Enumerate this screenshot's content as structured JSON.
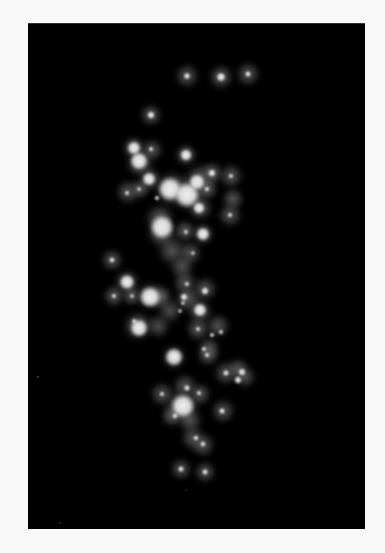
{
  "image": {
    "background": "#f8f8f8",
    "panel_color": "#000000",
    "panel": {
      "x": 28,
      "y": 23,
      "w": 337,
      "h": 505
    }
  },
  "halos": [
    {
      "x": 187,
      "y": 75,
      "r": 12,
      "a": 0.38
    },
    {
      "x": 221,
      "y": 76,
      "r": 12,
      "a": 0.42
    },
    {
      "x": 248,
      "y": 73,
      "r": 12,
      "a": 0.38
    },
    {
      "x": 151,
      "y": 114,
      "r": 11,
      "a": 0.4
    },
    {
      "x": 134,
      "y": 147,
      "r": 11,
      "a": 0.55
    },
    {
      "x": 140,
      "y": 162,
      "r": 13,
      "a": 0.55
    },
    {
      "x": 152,
      "y": 149,
      "r": 11,
      "a": 0.4
    },
    {
      "x": 150,
      "y": 178,
      "r": 11,
      "a": 0.5
    },
    {
      "x": 186,
      "y": 154,
      "r": 11,
      "a": 0.45
    },
    {
      "x": 128,
      "y": 191,
      "r": 12,
      "a": 0.4
    },
    {
      "x": 140,
      "y": 188,
      "r": 10,
      "a": 0.4
    },
    {
      "x": 172,
      "y": 188,
      "r": 16,
      "a": 0.62
    },
    {
      "x": 188,
      "y": 192,
      "r": 16,
      "a": 0.62
    },
    {
      "x": 200,
      "y": 178,
      "r": 14,
      "a": 0.5
    },
    {
      "x": 212,
      "y": 172,
      "r": 11,
      "a": 0.45
    },
    {
      "x": 231,
      "y": 175,
      "r": 12,
      "a": 0.4
    },
    {
      "x": 207,
      "y": 188,
      "r": 11,
      "a": 0.42
    },
    {
      "x": 200,
      "y": 207,
      "r": 12,
      "a": 0.45
    },
    {
      "x": 233,
      "y": 198,
      "r": 11,
      "a": 0.4
    },
    {
      "x": 230,
      "y": 214,
      "r": 12,
      "a": 0.38
    },
    {
      "x": 160,
      "y": 218,
      "r": 14,
      "a": 0.48
    },
    {
      "x": 162,
      "y": 232,
      "r": 14,
      "a": 0.5
    },
    {
      "x": 185,
      "y": 230,
      "r": 11,
      "a": 0.42
    },
    {
      "x": 203,
      "y": 233,
      "r": 11,
      "a": 0.45
    },
    {
      "x": 172,
      "y": 250,
      "r": 14,
      "a": 0.4
    },
    {
      "x": 190,
      "y": 252,
      "r": 12,
      "a": 0.38
    },
    {
      "x": 182,
      "y": 266,
      "r": 12,
      "a": 0.38
    },
    {
      "x": 112,
      "y": 259,
      "r": 11,
      "a": 0.4
    },
    {
      "x": 127,
      "y": 281,
      "r": 12,
      "a": 0.48
    },
    {
      "x": 114,
      "y": 295,
      "r": 11,
      "a": 0.4
    },
    {
      "x": 132,
      "y": 295,
      "r": 10,
      "a": 0.4
    },
    {
      "x": 150,
      "y": 295,
      "r": 13,
      "a": 0.55
    },
    {
      "x": 160,
      "y": 296,
      "r": 12,
      "a": 0.5
    },
    {
      "x": 185,
      "y": 282,
      "r": 12,
      "a": 0.38
    },
    {
      "x": 188,
      "y": 298,
      "r": 13,
      "a": 0.42
    },
    {
      "x": 205,
      "y": 288,
      "r": 12,
      "a": 0.4
    },
    {
      "x": 200,
      "y": 310,
      "r": 12,
      "a": 0.45
    },
    {
      "x": 170,
      "y": 310,
      "r": 12,
      "a": 0.35
    },
    {
      "x": 138,
      "y": 325,
      "r": 14,
      "a": 0.5
    },
    {
      "x": 158,
      "y": 325,
      "r": 12,
      "a": 0.35
    },
    {
      "x": 198,
      "y": 328,
      "r": 12,
      "a": 0.4
    },
    {
      "x": 218,
      "y": 325,
      "r": 12,
      "a": 0.38
    },
    {
      "x": 209,
      "y": 347,
      "r": 11,
      "a": 0.38
    },
    {
      "x": 174,
      "y": 356,
      "r": 12,
      "a": 0.45
    },
    {
      "x": 208,
      "y": 354,
      "r": 11,
      "a": 0.38
    },
    {
      "x": 226,
      "y": 372,
      "r": 12,
      "a": 0.38
    },
    {
      "x": 238,
      "y": 368,
      "r": 11,
      "a": 0.4
    },
    {
      "x": 245,
      "y": 376,
      "r": 11,
      "a": 0.35
    },
    {
      "x": 162,
      "y": 393,
      "r": 12,
      "a": 0.38
    },
    {
      "x": 185,
      "y": 385,
      "r": 12,
      "a": 0.4
    },
    {
      "x": 182,
      "y": 405,
      "r": 16,
      "a": 0.58
    },
    {
      "x": 200,
      "y": 393,
      "r": 11,
      "a": 0.4
    },
    {
      "x": 172,
      "y": 415,
      "r": 11,
      "a": 0.4
    },
    {
      "x": 190,
      "y": 420,
      "r": 12,
      "a": 0.38
    },
    {
      "x": 223,
      "y": 410,
      "r": 12,
      "a": 0.38
    },
    {
      "x": 193,
      "y": 437,
      "r": 12,
      "a": 0.38
    },
    {
      "x": 203,
      "y": 444,
      "r": 12,
      "a": 0.38
    },
    {
      "x": 181,
      "y": 468,
      "r": 11,
      "a": 0.36
    },
    {
      "x": 205,
      "y": 471,
      "r": 11,
      "a": 0.36
    }
  ],
  "cores": [
    {
      "x": 187,
      "y": 75,
      "r": 2.2
    },
    {
      "x": 221,
      "y": 76,
      "r": 3.0
    },
    {
      "x": 248,
      "y": 73,
      "r": 2.0
    },
    {
      "x": 151,
      "y": 114,
      "r": 2.5
    },
    {
      "x": 134,
      "y": 147,
      "r": 4.5
    },
    {
      "x": 139,
      "y": 160,
      "r": 6.0
    },
    {
      "x": 151,
      "y": 148,
      "r": 1.6
    },
    {
      "x": 149,
      "y": 178,
      "r": 4.5
    },
    {
      "x": 186,
      "y": 154,
      "r": 4.0
    },
    {
      "x": 127,
      "y": 192,
      "r": 1.6
    },
    {
      "x": 139,
      "y": 188,
      "r": 1.4
    },
    {
      "x": 170,
      "y": 188,
      "r": 8.0
    },
    {
      "x": 187,
      "y": 194,
      "r": 8.5
    },
    {
      "x": 197,
      "y": 181,
      "r": 5.5
    },
    {
      "x": 212,
      "y": 172,
      "r": 2.5
    },
    {
      "x": 231,
      "y": 175,
      "r": 1.6
    },
    {
      "x": 207,
      "y": 188,
      "r": 1.6
    },
    {
      "x": 199,
      "y": 207,
      "r": 4.0
    },
    {
      "x": 157,
      "y": 197,
      "r": 1.6
    },
    {
      "x": 230,
      "y": 214,
      "r": 1.6
    },
    {
      "x": 162,
      "y": 226,
      "r": 8.0
    },
    {
      "x": 186,
      "y": 231,
      "r": 1.5
    },
    {
      "x": 203,
      "y": 233,
      "r": 4.5
    },
    {
      "x": 193,
      "y": 252,
      "r": 1.4
    },
    {
      "x": 112,
      "y": 259,
      "r": 1.8
    },
    {
      "x": 127,
      "y": 281,
      "r": 5.0
    },
    {
      "x": 114,
      "y": 295,
      "r": 1.6
    },
    {
      "x": 132,
      "y": 295,
      "r": 1.4
    },
    {
      "x": 150,
      "y": 296,
      "r": 7.0
    },
    {
      "x": 187,
      "y": 283,
      "r": 1.6
    },
    {
      "x": 184,
      "y": 296,
      "r": 2.5
    },
    {
      "x": 205,
      "y": 290,
      "r": 2.5
    },
    {
      "x": 200,
      "y": 309,
      "r": 4.5
    },
    {
      "x": 180,
      "y": 310,
      "r": 1.4
    },
    {
      "x": 183,
      "y": 302,
      "r": 1.4
    },
    {
      "x": 139,
      "y": 327,
      "r": 6.0
    },
    {
      "x": 134,
      "y": 320,
      "r": 1.6
    },
    {
      "x": 198,
      "y": 328,
      "r": 1.6
    },
    {
      "x": 212,
      "y": 334,
      "r": 1.6
    },
    {
      "x": 221,
      "y": 331,
      "r": 1.6
    },
    {
      "x": 204,
      "y": 348,
      "r": 1.6
    },
    {
      "x": 207,
      "y": 354,
      "r": 1.6
    },
    {
      "x": 174,
      "y": 356,
      "r": 6.0
    },
    {
      "x": 226,
      "y": 372,
      "r": 2.0
    },
    {
      "x": 242,
      "y": 371,
      "r": 2.5
    },
    {
      "x": 238,
      "y": 379,
      "r": 2.5
    },
    {
      "x": 162,
      "y": 393,
      "r": 1.6
    },
    {
      "x": 187,
      "y": 387,
      "r": 2.0
    },
    {
      "x": 183,
      "y": 405,
      "r": 8.0
    },
    {
      "x": 199,
      "y": 392,
      "r": 1.6
    },
    {
      "x": 175,
      "y": 415,
      "r": 1.8
    },
    {
      "x": 222,
      "y": 410,
      "r": 2.0
    },
    {
      "x": 196,
      "y": 437,
      "r": 1.8
    },
    {
      "x": 203,
      "y": 443,
      "r": 1.8
    },
    {
      "x": 181,
      "y": 468,
      "r": 2.0
    },
    {
      "x": 205,
      "y": 471,
      "r": 2.0
    }
  ],
  "stray_specks": [
    {
      "x": 38,
      "y": 376,
      "r": 0.9
    },
    {
      "x": 60,
      "y": 522,
      "r": 0.8
    },
    {
      "x": 186,
      "y": 489,
      "r": 0.7
    }
  ]
}
